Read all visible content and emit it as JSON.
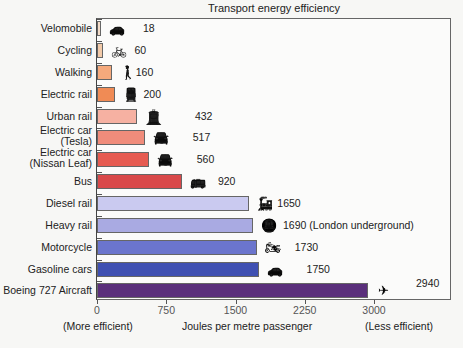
{
  "chart_data": {
    "type": "bar",
    "orientation": "horizontal",
    "title": "Transport energy efficiency",
    "xlabel": "Joules per metre passenger",
    "ylabel": "",
    "xlim": [
      0,
      3000
    ],
    "xticks": [
      0,
      750,
      1500,
      2250,
      3000
    ],
    "x_annotations": {
      "left": "(More efficient)",
      "right": "(Less efficient)"
    },
    "grid": false,
    "legend": null,
    "categories": [
      "Velomobile",
      "Cycling",
      "Walking",
      "Electric rail",
      "Urban rail",
      "Electric car (Tesla)",
      "Electric car (Nissan Leaf)",
      "Bus",
      "Diesel rail",
      "Heavy rail",
      "Motorcycle",
      "Gasoline cars",
      "Boeing 727 Aircraft"
    ],
    "values": [
      18,
      60,
      160,
      200,
      432,
      517,
      560,
      920,
      1650,
      1690,
      1730,
      1750,
      2940
    ],
    "value_labels": [
      "18",
      "60",
      "160",
      "200",
      "432",
      "517",
      "560",
      "920",
      "1650",
      "1690 (London underground)",
      "1730",
      "1750",
      "2940"
    ]
  },
  "bars": [
    {
      "label1": "Velomobile",
      "label2": "",
      "value": 18,
      "value_label": "18",
      "color": "#f3dcc9",
      "icon": "velomobile-icon",
      "glyph": "🚗"
    },
    {
      "label1": "Cycling",
      "label2": "",
      "value": 60,
      "value_label": "60",
      "color": "#f2caa9",
      "icon": "bicycle-icon",
      "glyph": "🚲"
    },
    {
      "label1": "Walking",
      "label2": "",
      "value": 160,
      "value_label": "160",
      "color": "#f5a97c",
      "icon": "walking-person-icon",
      "glyph": "🚶"
    },
    {
      "label1": "Electric rail",
      "label2": "",
      "value": 200,
      "value_label": "200",
      "color": "#f08b55",
      "icon": "electric-train-icon",
      "glyph": "🚆"
    },
    {
      "label1": "Urban rail",
      "label2": "",
      "value": 432,
      "value_label": "432",
      "color": "#f6b1a2",
      "icon": "tram-icon",
      "glyph": "🚊"
    },
    {
      "label1": "Electric car",
      "label2": "(Tesla)",
      "value": 517,
      "value_label": "517",
      "color": "#f08c7b",
      "icon": "electric-car-icon",
      "glyph": "🚘"
    },
    {
      "label1": "Electric car",
      "label2": "(Nissan Leaf)",
      "value": 560,
      "value_label": "560",
      "color": "#e65b51",
      "icon": "electric-car-icon",
      "glyph": "🚘"
    },
    {
      "label1": "Bus",
      "label2": "",
      "value": 920,
      "value_label": "920",
      "color": "#d9494a",
      "icon": "bus-stop-icon",
      "glyph": "🚌"
    },
    {
      "label1": "Diesel rail",
      "label2": "",
      "value": 1650,
      "value_label": "1650",
      "color": "#cacaf0",
      "icon": "diesel-train-icon",
      "glyph": "🚂"
    },
    {
      "label1": "Heavy rail",
      "label2": "",
      "value": 1690,
      "value_label": "1690 (London underground)",
      "color": "#a9aae2",
      "icon": "underground-train-icon",
      "glyph": "🚇"
    },
    {
      "label1": "Motorcycle",
      "label2": "",
      "value": 1730,
      "value_label": "1730",
      "color": "#6b75cd",
      "icon": "motorcycle-icon",
      "glyph": "🏍"
    },
    {
      "label1": "Gasoline cars",
      "label2": "",
      "value": 1750,
      "value_label": "1750",
      "color": "#3f50b2",
      "icon": "car-icon",
      "glyph": "🚗"
    },
    {
      "label1": "Boeing 727 Aircraft",
      "label2": "",
      "value": 2940,
      "value_label": "2940",
      "color": "#5a2f7b",
      "icon": "airplane-icon",
      "glyph": "✈"
    }
  ],
  "axis": {
    "ticks": [
      "0",
      "750",
      "1500",
      "2250",
      "3000"
    ],
    "left_note": "(More efficient)",
    "title": "Joules per metre passenger",
    "right_note": "(Less efficient)"
  },
  "title": "Transport energy efficiency"
}
